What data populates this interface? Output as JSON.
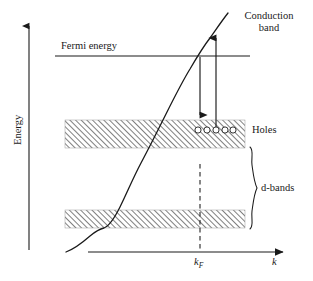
{
  "figure": {
    "background_color": "#ffffff",
    "ink_color": "#1a1a1a",
    "hatch_color": "#555555",
    "width": 313,
    "height": 281
  },
  "axes": {
    "y_axis": {
      "label": "Energy",
      "arrow_direction": "up",
      "x": 29,
      "y_top": 24,
      "y_bottom": 250
    },
    "x_axis": {
      "label": "k",
      "arrow_direction": "right",
      "y": 252,
      "x_left": 88,
      "x_right": 285
    }
  },
  "reference_lines": {
    "fermi": {
      "label": "Fermi energy",
      "y": 56,
      "x_start": 55,
      "x_end": 250,
      "style": "solid"
    },
    "k_fermi": {
      "label": "k",
      "label_subscript": "F",
      "x": 200,
      "y_top": 164,
      "y_bottom": 252,
      "style": "dashed"
    }
  },
  "bands": {
    "upper": {
      "name": "upper d-band",
      "x": 65,
      "y": 120,
      "width": 180,
      "height": 28,
      "fill": "hatched"
    },
    "lower": {
      "name": "lower d-band",
      "x": 65,
      "y": 210,
      "width": 180,
      "height": 18,
      "fill": "hatched"
    },
    "bracket_label": "d-bands",
    "bracket_top": 147,
    "bracket_bottom": 229
  },
  "holes": {
    "label": "Holes",
    "count": 5,
    "y": 130,
    "x_positions": [
      198,
      207,
      216,
      225,
      233
    ],
    "radius": 3.1
  },
  "conduction_band": {
    "label_line1": "Conduction",
    "label_line2": "band",
    "curve_description": "Steeply rising E(k) dispersion curve crossing the Fermi energy at k_F"
  },
  "transitions": {
    "down_arrow": {
      "name": "electron-transition-down",
      "x": 200,
      "y_start": 57,
      "y_end": 122
    },
    "up_arrow": {
      "name": "electron-transition-up",
      "x": 216,
      "y_start": 130,
      "y_end": 31
    }
  }
}
